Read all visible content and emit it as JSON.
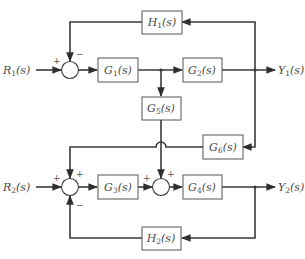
{
  "diagram": {
    "type": "control-system-block-diagram",
    "inputs": [
      {
        "id": "R1",
        "name": "R",
        "sub": "1",
        "suffix": "(s)"
      },
      {
        "id": "R2",
        "name": "R",
        "sub": "2",
        "suffix": "(s)"
      }
    ],
    "outputs": [
      {
        "id": "Y1",
        "name": "Y",
        "sub": "1",
        "suffix": "(s)"
      },
      {
        "id": "Y2",
        "name": "Y",
        "sub": "2",
        "suffix": "(s)"
      }
    ],
    "blocks": {
      "G1": {
        "name": "G",
        "sub": "1",
        "suffix": "(s)"
      },
      "G2": {
        "name": "G",
        "sub": "2",
        "suffix": "(s)"
      },
      "G3": {
        "name": "G",
        "sub": "3",
        "suffix": "(s)"
      },
      "G4": {
        "name": "G",
        "sub": "4",
        "suffix": "(s)"
      },
      "G5": {
        "name": "G",
        "sub": "5",
        "suffix": "(s)"
      },
      "G6": {
        "name": "G",
        "sub": "6",
        "suffix": "(s)"
      },
      "H1": {
        "name": "H",
        "sub": "1",
        "suffix": "(s)"
      },
      "H2": {
        "name": "H",
        "sub": "2",
        "suffix": "(s)"
      }
    },
    "summing_junctions": {
      "S1": {
        "signs": {
          "left": "+",
          "top": "−"
        }
      },
      "S2": {
        "signs": {
          "left": "+",
          "top": "+",
          "bottom": "−"
        }
      },
      "S3": {
        "signs": {
          "left": "+",
          "top": "+"
        }
      }
    },
    "connections": [
      "R1 → S1(+)",
      "S1 → G1",
      "G1 → G2",
      "G2 → Y1",
      "Y1 → H1 → S1(−)",
      "G1 output → G5 → S3(+)",
      "Y1 → G6 → S2(+)",
      "R2 → S2(+)",
      "S2 → G3",
      "G3 → S3(+)",
      "S3 → G4",
      "G4 → Y2",
      "Y2 → H2 → S2(−)"
    ],
    "colors": {
      "line": "#3a3a3a",
      "box": "#555555",
      "text": "#4a4a4a",
      "background": "#ffffff"
    }
  }
}
